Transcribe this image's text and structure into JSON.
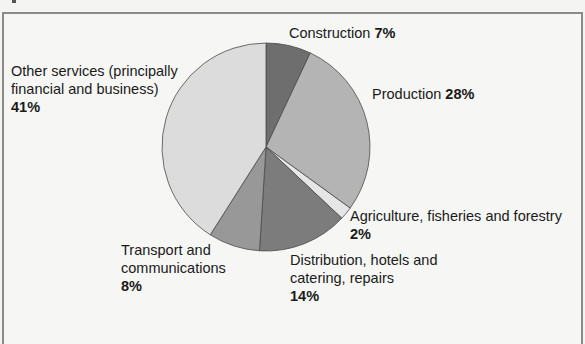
{
  "chart_data": {
    "type": "pie",
    "title": "",
    "start_angle_deg": 0,
    "direction": "clockwise",
    "slices": [
      {
        "name": "Construction",
        "label": "Construction",
        "value": 7,
        "pct": "7%",
        "color": "#6e6e6e"
      },
      {
        "name": "Production",
        "label": "Production",
        "value": 28,
        "pct": "28%",
        "color": "#b4b4b4"
      },
      {
        "name": "Agriculture",
        "label": "Agriculture, fisheries and forestry",
        "value": 2,
        "pct": "2%",
        "color": "#e6e6e6"
      },
      {
        "name": "Distribution",
        "label_lines": [
          "Distribution, hotels and",
          "catering, repairs"
        ],
        "value": 14,
        "pct": "14%",
        "color": "#7c7c7c"
      },
      {
        "name": "Transport",
        "label_lines": [
          "Transport and",
          "communications"
        ],
        "value": 8,
        "pct": "8%",
        "color": "#989898"
      },
      {
        "name": "Other services",
        "label_lines": [
          "Other services (principally",
          "financial and business)"
        ],
        "value": 41,
        "pct": "41%",
        "color": "#dcdcdc"
      }
    ]
  }
}
